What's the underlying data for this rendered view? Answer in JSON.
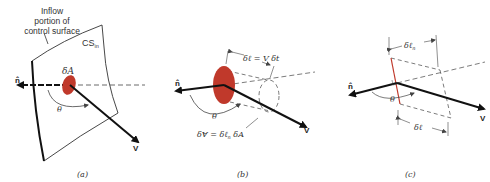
{
  "figure": {
    "panels": [
      {
        "id": "a",
        "caption": "(a)",
        "labels": {
          "inflow_line1": "Inflow",
          "inflow_line2": "portion of",
          "inflow_line3": "control surface",
          "cs": "CS",
          "cs_sub": "in",
          "area": "δA",
          "normal": "n̂",
          "angle": "θ",
          "velocity": "V"
        }
      },
      {
        "id": "b",
        "caption": "(b)",
        "labels": {
          "length_eq": "δℓ = V δt",
          "volume_eq_pre": "δⱯ = δℓ",
          "volume_eq_sub": "n",
          "volume_eq_post": " δA",
          "normal": "n̂",
          "angle": "θ",
          "velocity": "V"
        }
      },
      {
        "id": "c",
        "caption": "(c)",
        "labels": {
          "normal_length": "δℓ",
          "normal_length_sub": "n",
          "length": "δℓ",
          "normal": "n̂",
          "angle": "θ",
          "velocity": "V"
        }
      }
    ],
    "colors": {
      "area_fill": "#c0392b",
      "line": "#111111",
      "thin_line": "#444444",
      "red_edge": "#c0392b"
    }
  }
}
